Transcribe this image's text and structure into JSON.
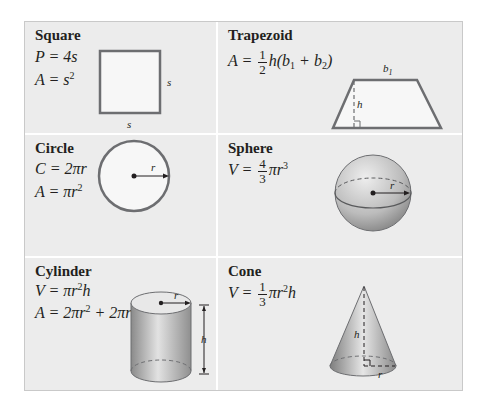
{
  "cells": {
    "square": {
      "title": "Square",
      "formulas": {
        "perimeter": "P = 4s",
        "area_lhs": "A = s",
        "area_exp": "2"
      },
      "labels": {
        "side_right": "s",
        "side_bottom": "s"
      }
    },
    "trapezoid": {
      "title": "Trapezoid",
      "formula": {
        "lhs": "A =",
        "frac_num": "1",
        "frac_den": "2",
        "rhs_a": "h(b",
        "sub1": "1",
        "rhs_b": " + b",
        "sub2": "2",
        "rhs_c": ")"
      },
      "labels": {
        "top": "b1",
        "bottom": "b2",
        "height": "h"
      }
    },
    "circle": {
      "title": "Circle",
      "formulas": {
        "circumference": "C = 2πr",
        "area_lhs": "A = πr",
        "area_exp": "2"
      },
      "labels": {
        "radius": "r"
      }
    },
    "sphere": {
      "title": "Sphere",
      "formula": {
        "lhs": "V =",
        "frac_num": "4",
        "frac_den": "3",
        "rhs": "πr",
        "exp": "3"
      },
      "labels": {
        "radius": "r"
      }
    },
    "cylinder": {
      "title": "Cylinder",
      "formulas": {
        "volume_lhs": "V = πr",
        "volume_exp": "2",
        "volume_rhs": "h",
        "area_a": "A = 2πr",
        "area_exp": "2",
        "area_b": " + 2πrh"
      },
      "labels": {
        "radius": "r",
        "height": "h"
      }
    },
    "cone": {
      "title": "Cone",
      "formula": {
        "lhs": "V =",
        "frac_num": "1",
        "frac_den": "3",
        "rhs": "πr",
        "exp": "2",
        "rhs2": "h"
      },
      "labels": {
        "height": "h",
        "radius": "r"
      }
    }
  }
}
